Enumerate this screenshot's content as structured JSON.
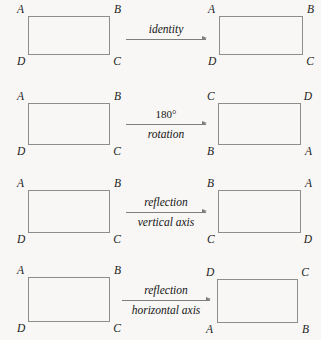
{
  "figure": {
    "colors": {
      "background": "#f8f7f5",
      "stroke": "#8d8d8b",
      "arrow": "#7e7e7c",
      "text": "#141414"
    },
    "rows": [
      {
        "id": "identity",
        "source": {
          "top_left": "A",
          "top_right": "B",
          "bottom_left": "D",
          "bottom_right": "C"
        },
        "label_above": "identity",
        "label_below": "",
        "result": {
          "top_left": "A",
          "top_right": "B",
          "bottom_left": "D",
          "bottom_right": "C"
        }
      },
      {
        "id": "rotation-180",
        "source": {
          "top_left": "A",
          "top_right": "B",
          "bottom_left": "D",
          "bottom_right": "C"
        },
        "label_above": "180°",
        "label_below": "rotation",
        "result": {
          "top_left": "C",
          "top_right": "D",
          "bottom_left": "B",
          "bottom_right": "A"
        }
      },
      {
        "id": "reflection-vertical-axis",
        "source": {
          "top_left": "A",
          "top_right": "B",
          "bottom_left": "D",
          "bottom_right": "C"
        },
        "label_above": "reflection",
        "label_below": "vertical axis",
        "result": {
          "top_left": "B",
          "top_right": "A",
          "bottom_left": "C",
          "bottom_right": "D"
        }
      },
      {
        "id": "reflection-horizontal-axis",
        "source": {
          "top_left": "A",
          "top_right": "B",
          "bottom_left": "D",
          "bottom_right": "C"
        },
        "label_above": "reflection",
        "label_below": "horizontal axis",
        "result": {
          "top_left": "D",
          "top_right": "C",
          "bottom_left": "A",
          "bottom_right": "B"
        }
      }
    ]
  }
}
